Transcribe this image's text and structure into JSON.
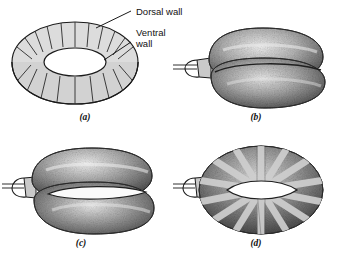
{
  "figure": {
    "background_color": "#ffffff",
    "width": 343,
    "height": 257,
    "outline_color": "#1a1a1a",
    "fill_light_gray": "#d8d8d8",
    "fill_mid_gray": "#9a9a9a",
    "fill_dark_gray": "#4a4a4a",
    "hole_color": "#ffffff"
  },
  "annotations": {
    "dorsal_label": "Dorsal wall",
    "ventral_label_line1": "Ventral",
    "ventral_label_line2": "wall"
  },
  "panels": [
    {
      "id": "a",
      "caption": "(a)",
      "description": "line diagram of segmented torus with central elliptical hole",
      "style": "line-art",
      "segments": 18,
      "has_hole": true,
      "has_tube": false
    },
    {
      "id": "b",
      "caption": "(b)",
      "description": "inflated stippled torus, collapsed hole, inflation tube at left",
      "style": "stippled",
      "segments": 0,
      "has_hole": false,
      "has_tube": true
    },
    {
      "id": "c",
      "caption": "(c)",
      "description": "stippled torus with open slit-like central hole, inflation tube at left",
      "style": "stippled",
      "segments": 0,
      "has_hole": true,
      "has_tube": true
    },
    {
      "id": "d",
      "caption": "(d)",
      "description": "stippled torus with light radial bands and open lens-shaped hole, tube at left",
      "style": "stippled-banded",
      "segments": 12,
      "has_hole": true,
      "has_tube": true
    }
  ]
}
